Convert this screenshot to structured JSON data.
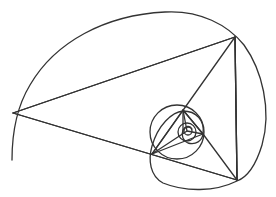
{
  "diagram": {
    "type": "golden-triangle-spiral",
    "stroke_color": "#333333",
    "background": "#ffffff",
    "spiral_path": "M 12 160 C 12 135, 16 108, 30 85 C 55 42, 105 15, 165 12 C 200 10, 228 25, 244 45 C 262 70, 272 110, 262 145 C 255 168, 245 178, 237 181 C 215 192, 185 192, 163 183 C 150 176, 148 160, 152 146 C 158 125, 172 112, 183 111 C 196 111, 205 120, 203 134 C 202 141, 196 145, 188 143 C 183 141, 181 135, 183 130 C 185 126, 190 125, 192 129",
    "triangles": [
      {
        "name": "large-triangle",
        "points": "13,113 235,37 237,180"
      },
      {
        "name": "medium-triangle",
        "points": "152,154 183,110 203,134"
      },
      {
        "name": "small-triangle",
        "points": "183,110 203,134 187,131"
      }
    ],
    "segments": [
      {
        "name": "segment-a-to-d",
        "x1": 13,
        "y1": 113,
        "x2": 237,
        "y2": 180
      },
      {
        "name": "segment-b-to-d",
        "x1": 235,
        "y1": 37,
        "x2": 152,
        "y2": 154
      },
      {
        "name": "segment-b-to-c",
        "x1": 235,
        "y1": 37,
        "x2": 237,
        "y2": 180
      },
      {
        "name": "segment-d-to-f",
        "x1": 152,
        "y1": 154,
        "x2": 187,
        "y2": 131
      },
      {
        "name": "segment-f-to-c",
        "x1": 203,
        "y1": 134,
        "x2": 237,
        "y2": 180
      },
      {
        "name": "segment-e-to-inner",
        "x1": 183,
        "y1": 110,
        "x2": 183,
        "y2": 133
      }
    ],
    "circles": [
      {
        "name": "medium-circle",
        "cx": 177,
        "cy": 132,
        "r": 27
      },
      {
        "name": "small-circle",
        "cx": 187,
        "cy": 132,
        "r": 9
      },
      {
        "name": "tiny-circle",
        "cx": 188,
        "cy": 131,
        "r": 4
      }
    ]
  }
}
